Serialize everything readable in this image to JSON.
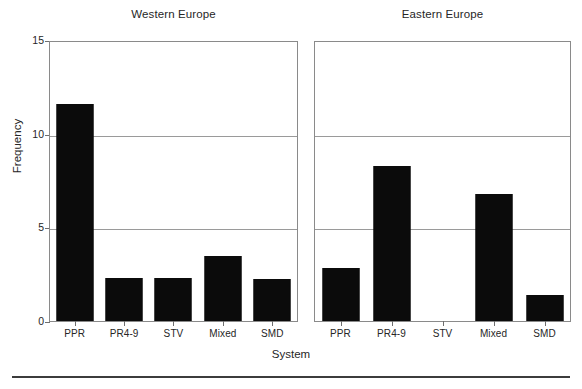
{
  "figure": {
    "xlabel": "System",
    "ylabel": "Frequency"
  },
  "chart_data": {
    "type": "bar",
    "title": "",
    "xlabel": "System",
    "ylabel": "Frequency",
    "ylim": [
      0,
      15
    ],
    "yticks": [
      0,
      5,
      10,
      15
    ],
    "ytick_labels": [
      "0",
      "5",
      "10",
      "15"
    ],
    "grid": true,
    "grid_axis": "y",
    "legend": "none",
    "bar_color": "#0b0b0b",
    "categories": [
      "PPR",
      "PR4-9",
      "STV",
      "Mixed",
      "SMD"
    ],
    "panels": [
      {
        "title": "Western Europe",
        "categories": [
          "PPR",
          "PR4-9",
          "STV",
          "Mixed",
          "SMD"
        ],
        "values": [
          11.6,
          2.3,
          2.3,
          3.45,
          2.25
        ]
      },
      {
        "title": "Eastern Europe",
        "categories": [
          "PPR",
          "PR4-9",
          "STV",
          "Mixed",
          "SMD"
        ],
        "values": [
          2.85,
          8.3,
          0,
          6.8,
          1.4
        ]
      }
    ],
    "series": [
      {
        "name": "Western Europe",
        "values": [
          11.6,
          2.3,
          2.3,
          3.45,
          2.25
        ]
      },
      {
        "name": "Eastern Europe",
        "values": [
          2.85,
          8.3,
          0,
          6.8,
          1.4
        ]
      }
    ]
  }
}
